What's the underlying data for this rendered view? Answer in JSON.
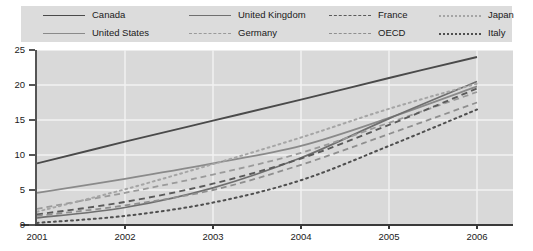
{
  "chart_data": {
    "type": "line",
    "title": "",
    "xlabel": "",
    "ylabel": "",
    "x": [
      2001,
      2002,
      2003,
      2004,
      2005,
      2006
    ],
    "categories": [
      "2001",
      "2002",
      "2003",
      "2004",
      "2005",
      "2006"
    ],
    "xlim": [
      2001,
      2006
    ],
    "ylim": [
      0,
      25
    ],
    "yticks": [
      0,
      5,
      10,
      15,
      20,
      25
    ],
    "ytick_labels": [
      "0",
      "5",
      "10",
      "15",
      "20",
      "25"
    ],
    "grid": true,
    "legend_position": "top",
    "series": [
      {
        "name": "Canada",
        "style": "solid",
        "color": "#4a4a4a",
        "width": 1.9,
        "values": [
          8.8,
          11.9,
          14.9,
          17.9,
          21.0,
          24.0
        ]
      },
      {
        "name": "United States",
        "style": "solid",
        "color": "#8a8a8a",
        "width": 1.7,
        "values": [
          4.6,
          6.6,
          8.8,
          11.3,
          15.3,
          19.8
        ]
      },
      {
        "name": "United Kingdom",
        "style": "solid",
        "color": "#6f6f6f",
        "width": 1.7,
        "values": [
          1.0,
          2.5,
          5.3,
          9.6,
          15.2,
          20.5
        ]
      },
      {
        "name": "Germany",
        "style": "dashed",
        "color": "#9a9a9a",
        "width": 1.8,
        "values": [
          2.3,
          4.6,
          7.2,
          10.3,
          14.6,
          19.0
        ]
      },
      {
        "name": "France",
        "style": "dashed",
        "color": "#5a5a5a",
        "width": 1.9,
        "values": [
          1.5,
          3.3,
          5.9,
          9.5,
          14.3,
          19.5
        ]
      },
      {
        "name": "OECD",
        "style": "dashed",
        "color": "#8f8f8f",
        "width": 1.8,
        "values": [
          1.3,
          2.8,
          5.0,
          8.6,
          13.0,
          17.5
        ]
      },
      {
        "name": "Japan",
        "style": "dotted",
        "color": "#a5a5a5",
        "width": 2.0,
        "values": [
          1.9,
          5.1,
          8.7,
          12.5,
          16.6,
          20.2
        ]
      },
      {
        "name": "Italy",
        "style": "dotted",
        "color": "#4f4f4f",
        "width": 2.0,
        "values": [
          0.3,
          1.3,
          3.2,
          6.4,
          11.3,
          16.5
        ]
      }
    ]
  },
  "legend": {
    "entries": [
      {
        "label": "Canada"
      },
      {
        "label": "United Kingdom"
      },
      {
        "label": "France"
      },
      {
        "label": "Japan"
      },
      {
        "label": "United States"
      },
      {
        "label": "Germany"
      },
      {
        "label": "OECD"
      },
      {
        "label": "Italy"
      }
    ]
  },
  "colors": {
    "legend_background": "#dcdcdc",
    "plot_background": "#d9d9d9",
    "gridline": "#f2f2f2",
    "axis": "#3a3a3a",
    "text": "#1a1a1a"
  }
}
